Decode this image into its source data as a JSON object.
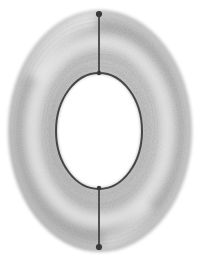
{
  "figure": {
    "name": "torus-sketch",
    "title": "Torus",
    "medium": "pencil-sketch",
    "background_color": "#ffffff",
    "canvas": {
      "width": 211,
      "height": 265
    },
    "ink_color": "#3a3a3a",
    "shade_color": "#9a9a9a",
    "highlight_color": "#ffffff"
  },
  "outer_ring": {
    "label": "outer-tube-boundary",
    "shape": "ellipse",
    "center_x": 100,
    "center_y": 131,
    "radius_x": 93,
    "radius_y": 122,
    "stroke": "#8d8d8d",
    "fill_gradient_from": "#ffffff",
    "fill_gradient_to": "#b9b9b9"
  },
  "inner_hole": {
    "label": "inner-hole-boundary",
    "shape": "ellipse",
    "center_x": 99,
    "center_y": 131,
    "radius_x": 43,
    "radius_y": 58,
    "stroke": "#3f3f3f",
    "stroke_width": 2.0,
    "fill": "#ffffff"
  },
  "meridian_top": {
    "label": "top-meridian-line",
    "x": 99,
    "y_start": 14,
    "y_end": 73,
    "stroke": "#454545",
    "stroke_width": 1.8
  },
  "meridian_bottom": {
    "label": "bottom-meridian-line",
    "x": 99,
    "y_start": 188,
    "y_end": 247,
    "stroke": "#454545",
    "stroke_width": 1.8
  },
  "node_top": {
    "label": "top-vertex-dot",
    "cx": 99,
    "cy": 14,
    "r": 3.1,
    "fill": "#3a3a3a"
  },
  "node_bottom": {
    "label": "bottom-vertex-dot",
    "cx": 99,
    "cy": 247,
    "r": 3.1,
    "fill": "#3a3a3a"
  },
  "node_inner_top": {
    "label": "inner-top-junction-dot",
    "cx": 99,
    "cy": 73,
    "r": 2.2,
    "fill": "#3a3a3a"
  },
  "node_inner_bottom": {
    "label": "inner-bottom-junction-dot",
    "cx": 99,
    "cy": 188,
    "r": 2.2,
    "fill": "#3a3a3a"
  },
  "shading": {
    "label": "tube-shading",
    "note": "stippled graphite shading, darkest along outer rim, lightest on inner crest",
    "grain_opacity": 0.3
  },
  "chart_data": {
    "type": "scatter",
    "title": "Torus",
    "xlabel": "",
    "ylabel": "",
    "grid": false,
    "legend": "none",
    "xlim": [
      0,
      211
    ],
    "ylim": [
      0,
      265
    ],
    "annotations": [
      {
        "name": "outer-boundary",
        "cx": 100,
        "cy": 131,
        "rx": 93,
        "ry": 122
      },
      {
        "name": "inner-boundary",
        "cx": 99,
        "cy": 131,
        "rx": 43,
        "ry": 58
      },
      {
        "name": "meridian-top",
        "x": 99,
        "y0": 14,
        "y1": 73
      },
      {
        "name": "meridian-bottom",
        "x": 99,
        "y0": 188,
        "y1": 247
      }
    ],
    "x": [
      99,
      99,
      99,
      99
    ],
    "y": [
      14,
      73,
      188,
      247
    ],
    "point_labels": [
      "top-vertex",
      "inner-top",
      "inner-bottom",
      "bottom-vertex"
    ]
  }
}
